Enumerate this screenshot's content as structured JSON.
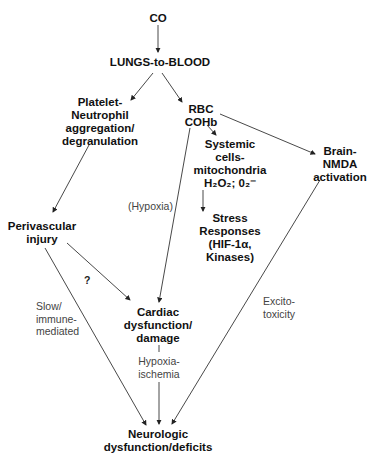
{
  "diagram": {
    "nodes": {
      "co": "CO",
      "lungs": "LUNGS-to-BLOOD",
      "platelet": "Platelet-\nNeutrophil\naggregation/\ndegranulation",
      "rbc": "RBC\nCOHb",
      "systemic": "Systemic\ncells-\nmitochondria",
      "ros": "H₂O₂; 0₂⁻",
      "brain": "Brain-\nNMDA\nactivation",
      "stress": "Stress\nResponses\n(HIF-1α,\nKinases)",
      "perivascular": "Perivascular\ninjury",
      "cardiac": "Cardiac\ndysfunction/\ndamage",
      "neuro": "Neurologic\ndysfunction/deficits"
    },
    "edge_labels": {
      "hypoxia": "(Hypoxia)",
      "question": "?",
      "slow": "Slow/\nimmune-\nmediated",
      "hypoxia_ischemia": "Hypoxia-\nischemia",
      "excito": "Excito-\ntoxicity"
    }
  }
}
